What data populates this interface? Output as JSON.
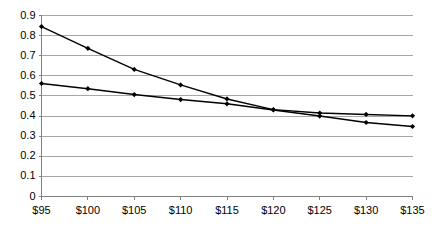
{
  "chart_data": {
    "type": "line",
    "title": "",
    "subtitle": "",
    "xlabel": "",
    "ylabel": "",
    "categories": [
      "$95",
      "$100",
      "$105",
      "$110",
      "$115",
      "$120",
      "$125",
      "$130",
      "$135"
    ],
    "x_values": [
      95,
      100,
      105,
      110,
      115,
      120,
      125,
      130,
      135
    ],
    "series": [
      {
        "name": "Series 1",
        "color": "#000000",
        "marker": "diamond",
        "values": [
          0.845,
          0.737,
          0.632,
          0.555,
          0.485,
          0.432,
          0.415,
          0.408,
          0.401
        ]
      },
      {
        "name": "Series 2",
        "color": "#000000",
        "marker": "diamond",
        "values": [
          0.562,
          0.536,
          0.507,
          0.482,
          0.461,
          0.43,
          0.4,
          0.368,
          0.348
        ]
      }
    ],
    "ylim": [
      0,
      0.9
    ],
    "y_ticks": [
      "0",
      "0.1",
      "0.2",
      "0.3",
      "0.4",
      "0.5",
      "0.6",
      "0.7",
      "0.8",
      "0.9"
    ],
    "y_tick_values": [
      0,
      0.1,
      0.2,
      0.3,
      0.4,
      0.5,
      0.6,
      0.7,
      0.8,
      0.9
    ],
    "grid": true,
    "grid_axis": "y",
    "legend": false,
    "legend_position": "none",
    "annotations": [],
    "colors": {
      "background": "#ffffff",
      "grid": "#a6a6a6",
      "axis": "#808080",
      "series": "#000000",
      "text": "#000000"
    }
  }
}
